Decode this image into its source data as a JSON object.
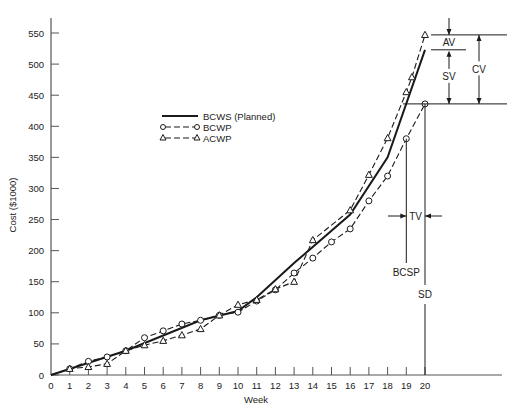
{
  "chart_data": {
    "type": "line",
    "title": "",
    "xlabel": "Week",
    "ylabel": "Cost ($1000)",
    "xlim": [
      0,
      20
    ],
    "ylim": [
      0,
      550
    ],
    "x_ticks": [
      0,
      1,
      2,
      3,
      4,
      5,
      6,
      7,
      8,
      9,
      10,
      11,
      12,
      13,
      14,
      15,
      16,
      17,
      18,
      19,
      20
    ],
    "y_ticks": [
      0,
      50,
      100,
      150,
      200,
      250,
      300,
      350,
      400,
      450,
      500,
      550
    ],
    "grid": false,
    "legend_position": "upper-left (inside)",
    "series": [
      {
        "name": "BCWS (Planned)",
        "style": "solid, no markers",
        "x": [
          0,
          4,
          8,
          10,
          11,
          13,
          16,
          18,
          20
        ],
        "values": [
          0,
          39,
          88,
          103,
          125,
          180,
          258,
          350,
          523
        ]
      },
      {
        "name": "BCWP",
        "style": "dashed, circle markers",
        "x": [
          1,
          2,
          3,
          4,
          5,
          6,
          7,
          8,
          9,
          10,
          11,
          12,
          13,
          14,
          15,
          16,
          17,
          18,
          19,
          20
        ],
        "values": [
          10,
          22,
          29,
          39,
          60,
          71,
          82,
          88,
          96,
          101,
          119,
          137,
          164,
          188,
          214,
          235,
          280,
          320,
          380,
          436
        ]
      },
      {
        "name": "ACWP",
        "style": "dashed, triangle markers",
        "x": [
          1,
          2,
          3,
          4,
          5,
          6,
          7,
          8,
          9,
          10,
          11,
          12,
          13,
          14,
          16,
          17,
          18,
          19,
          19.3,
          20
        ],
        "values": [
          10,
          13,
          18,
          39,
          48,
          55,
          64,
          74,
          96,
          113,
          121,
          138,
          150,
          217,
          265,
          322,
          381,
          455,
          479,
          547
        ]
      }
    ],
    "annotations": [
      {
        "label": "AV",
        "description": "Accounting variance: gap between ACWP and BCWS at week 20"
      },
      {
        "label": "SV",
        "description": "Schedule variance: gap between BCWS and BCWP at week 20"
      },
      {
        "label": "CV",
        "description": "Cost variance: gap between ACWP and BCWP at week 20"
      },
      {
        "label": "TV",
        "description": "Time variance between BCSP and SD"
      },
      {
        "label": "BCSP",
        "description": "Vertical line at ~week 19"
      },
      {
        "label": "SD",
        "description": "Vertical line at week 20 (status date)"
      }
    ]
  },
  "axis": {
    "ylabel": "Cost ($1000)",
    "xlabel": "Week",
    "y_ticks": [
      "0",
      "50",
      "100",
      "150",
      "200",
      "250",
      "300",
      "350",
      "400",
      "450",
      "500",
      "550"
    ],
    "x_ticks": [
      "0",
      "1",
      "2",
      "3",
      "4",
      "5",
      "6",
      "7",
      "8",
      "9",
      "10",
      "11",
      "12",
      "13",
      "14",
      "15",
      "16",
      "17",
      "18",
      "19",
      "20"
    ]
  },
  "legend": {
    "bcws": "BCWS (Planned)",
    "bcwp": "BCWP",
    "acwp": "ACWP"
  },
  "annotations": {
    "av": "AV",
    "sv": "SV",
    "cv": "CV",
    "tv": "TV",
    "bcsp": "BCSP",
    "sd": "SD"
  },
  "colors": {
    "line": "#1a1a1a",
    "axis": "#555555",
    "background": "#ffffff"
  }
}
